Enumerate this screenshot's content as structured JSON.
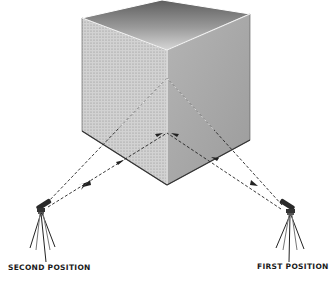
{
  "diagram": {
    "labels": {
      "second_position": "SECOND POSITION",
      "first_position": "FIRST POSITION"
    },
    "elements": [
      {
        "name": "cube",
        "faces": [
          "top-face",
          "left-face",
          "right-face"
        ]
      },
      {
        "name": "telescope-second-position",
        "side": "left"
      },
      {
        "name": "telescope-first-position",
        "side": "right"
      },
      {
        "name": "sight-lines",
        "style": "dashed with arrowheads",
        "count": 4
      }
    ],
    "colors": {
      "line": "#222222",
      "left_face": "#c8c8c8",
      "right_face": "#a9a9a9",
      "top_face_dark": "#6e6e6e",
      "top_face_light": "#d8d8d8",
      "background": "#ffffff"
    }
  }
}
